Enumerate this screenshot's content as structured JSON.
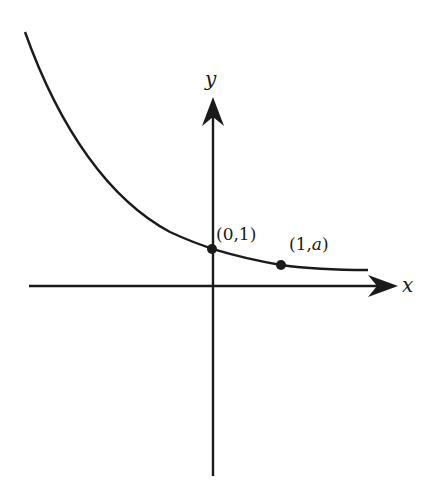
{
  "diagram": {
    "title": "",
    "type": "exponential-decay-graph",
    "axes": {
      "x_label": "x",
      "y_label": "y"
    },
    "points": [
      {
        "label_open": "(0,1)",
        "text": "(0,1)"
      },
      {
        "text_prefix": "(1,",
        "text_var": "a",
        "text_suffix": ")"
      }
    ],
    "colors": {
      "ink": "#1a1a1a",
      "background": "#ffffff"
    }
  }
}
